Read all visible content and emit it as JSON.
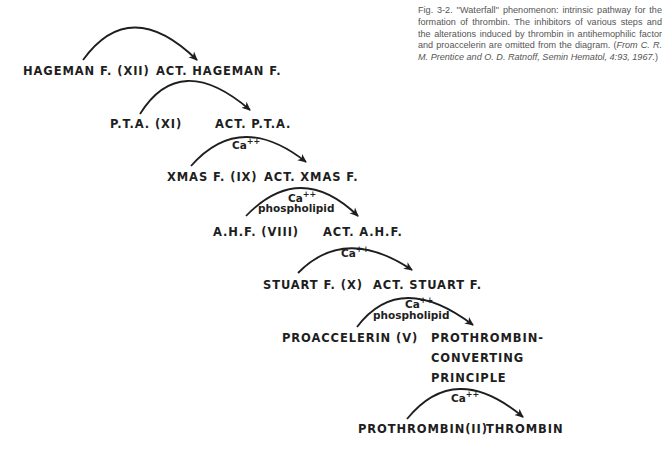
{
  "caption": {
    "lead": "Fig. 3-2. ''Waterfall'' phenomenon: intrinsic pathway for the formation of thrombin. The inhibitors of various steps and the alterations induced by thrombin in antihemophilic factor and proaccelerin are omitted from the diagram. (",
    "citation": "From C. R. M. Prentice and O. D. Ratnoff, Semin Hematol, 4:93, 1967.",
    "tail": ")"
  },
  "steps": [
    {
      "substrate": "HAGEMAN  F. (XII)",
      "product": "ACT. HAGEMAN  F.",
      "cofactor_main": "",
      "cofactor_sup": "",
      "cofactor_extra": ""
    },
    {
      "substrate": "P.T.A. (XI)",
      "product": "ACT. P.T.A.",
      "cofactor_main": "",
      "cofactor_sup": "",
      "cofactor_extra": ""
    },
    {
      "substrate": "XMAS  F. (IX)",
      "product": "ACT.  XMAS  F.",
      "cofactor_main": "Ca",
      "cofactor_sup": "++",
      "cofactor_extra": ""
    },
    {
      "substrate": "A.H.F. (VIII)",
      "product": "ACT.  A.H.F.",
      "cofactor_main": "Ca",
      "cofactor_sup": "++",
      "cofactor_extra": "phospholipid"
    },
    {
      "substrate": "STUART  F. (X)",
      "product": "ACT.  STUART  F.",
      "cofactor_main": "Ca",
      "cofactor_sup": "++",
      "cofactor_extra": ""
    },
    {
      "substrate": "PROACCELERIN (V)",
      "product": "PROTHROMBIN-",
      "product_line2": "CONVERTING",
      "product_line3": "PRINCIPLE",
      "cofactor_main": "Ca",
      "cofactor_sup": "++",
      "cofactor_extra": "phospholipid"
    },
    {
      "substrate": "PROTHROMBIN(II)",
      "product": "THROMBIN",
      "cofactor_main": "Ca",
      "cofactor_sup": "++",
      "cofactor_extra": ""
    }
  ],
  "colors": {
    "ink": "#1e1e1e",
    "caption": "#555555",
    "background": "#ffffff"
  }
}
